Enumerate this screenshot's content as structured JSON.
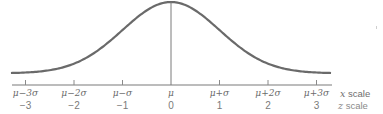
{
  "chart_data": {
    "type": "line",
    "title": "",
    "curve": "normal pdf, symmetric about mu",
    "x_tick_labels": [
      "μ−3σ",
      "μ−2σ",
      "μ−σ",
      "μ",
      "μ+σ",
      "μ+2σ",
      "μ+3σ"
    ],
    "z_tick_labels": [
      "−3",
      "−2",
      "−1",
      "0",
      "1",
      "2",
      "3"
    ],
    "z_values": [
      -3,
      -2,
      -1,
      0,
      1,
      2,
      3
    ],
    "x_scale_label": "x scale",
    "z_scale_label": "z scale",
    "xlim": [
      -3.3,
      3.3
    ],
    "grid": false,
    "center_line_at": 0,
    "colors": {
      "curve": "#6a6a6a",
      "axis": "#7a7a7a",
      "labels": "#6b6b6b"
    }
  },
  "scale_names": {
    "x_var": "x",
    "x_word": "scale",
    "z_var": "z",
    "z_word": "scale"
  }
}
